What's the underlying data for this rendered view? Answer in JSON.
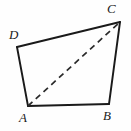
{
  "figure": {
    "kind": "geometry-diagram",
    "shape": "quadrilateral",
    "canvas": {
      "width": 131,
      "height": 131,
      "background": "#fefefe"
    },
    "stroke": {
      "color": "#1a1a1a",
      "solid_width": 1.9,
      "dashed_width": 1.7,
      "dash_pattern": "6 4.5"
    },
    "vertices": [
      {
        "id": "A",
        "label": "A",
        "x": 28,
        "y": 106
      },
      {
        "id": "B",
        "label": "B",
        "x": 109,
        "y": 104
      },
      {
        "id": "C",
        "label": "C",
        "x": 120,
        "y": 22
      },
      {
        "id": "D",
        "label": "D",
        "x": 17,
        "y": 47
      }
    ],
    "edges": [
      {
        "id": "AB",
        "from": "A",
        "to": "B",
        "style": "solid"
      },
      {
        "id": "BC",
        "from": "B",
        "to": "C",
        "style": "solid"
      },
      {
        "id": "CD",
        "from": "C",
        "to": "D",
        "style": "solid"
      },
      {
        "id": "DA",
        "from": "D",
        "to": "A",
        "style": "solid"
      }
    ],
    "diagonals": [
      {
        "id": "AC",
        "from": "A",
        "to": "C",
        "style": "dashed"
      }
    ],
    "outline_path": "M 28 106 L 109 104 L 120 22 L 17 47 Z",
    "diagonal_path": "M 28 106 L 120 22"
  }
}
